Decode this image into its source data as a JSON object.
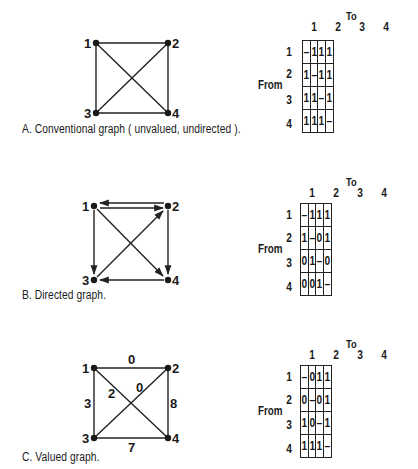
{
  "panels": [
    {
      "id": "A",
      "caption": "A. Conventional graph ( unvalued, undirected ).",
      "graph": {
        "type": "undirected",
        "nodes": [
          "1",
          "2",
          "3",
          "4"
        ],
        "edges": [
          {
            "from": "1",
            "to": "2"
          },
          {
            "from": "1",
            "to": "3"
          },
          {
            "from": "1",
            "to": "4"
          },
          {
            "from": "2",
            "to": "3"
          },
          {
            "from": "2",
            "to": "4"
          },
          {
            "from": "3",
            "to": "4"
          }
        ]
      },
      "matrix": {
        "to_label": "To",
        "from_label": "From",
        "columns": [
          "1",
          "2",
          "3",
          "4"
        ],
        "rows": [
          {
            "label": "1",
            "cells": [
              "–",
              "1",
              "1",
              "1"
            ]
          },
          {
            "label": "2",
            "cells": [
              "1",
              "–",
              "1",
              "1"
            ]
          },
          {
            "label": "3",
            "cells": [
              "1",
              "1",
              "–",
              "1"
            ]
          },
          {
            "label": "4",
            "cells": [
              "1",
              "1",
              "1",
              "–"
            ]
          }
        ]
      }
    },
    {
      "id": "B",
      "caption": "B. Directed graph.",
      "graph": {
        "type": "directed",
        "nodes": [
          "1",
          "2",
          "3",
          "4"
        ],
        "edges": [
          {
            "from": "1",
            "to": "2"
          },
          {
            "from": "2",
            "to": "1"
          },
          {
            "from": "1",
            "to": "3"
          },
          {
            "from": "1",
            "to": "4"
          },
          {
            "from": "2",
            "to": "4"
          },
          {
            "from": "3",
            "to": "2"
          },
          {
            "from": "4",
            "to": "3"
          }
        ]
      },
      "matrix": {
        "to_label": "To",
        "from_label": "From",
        "columns": [
          "1",
          "2",
          "3",
          "4"
        ],
        "rows": [
          {
            "label": "1",
            "cells": [
              "–",
              "1",
              "1",
              "1"
            ]
          },
          {
            "label": "2",
            "cells": [
              "1",
              "–",
              "0",
              "1"
            ]
          },
          {
            "label": "3",
            "cells": [
              "0",
              "1",
              "–",
              "0"
            ]
          },
          {
            "label": "4",
            "cells": [
              "0",
              "0",
              "1",
              "–"
            ]
          }
        ]
      }
    },
    {
      "id": "C",
      "caption": "C. Valued graph.",
      "graph": {
        "type": "valued",
        "nodes": [
          "1",
          "2",
          "3",
          "4"
        ],
        "edges": [
          {
            "from": "1",
            "to": "2",
            "value": "0"
          },
          {
            "from": "1",
            "to": "3",
            "value": "3"
          },
          {
            "from": "1",
            "to": "4",
            "value": "2"
          },
          {
            "from": "2",
            "to": "3",
            "value": "0"
          },
          {
            "from": "2",
            "to": "4",
            "value": "8"
          },
          {
            "from": "3",
            "to": "4",
            "value": "7"
          }
        ]
      },
      "matrix": {
        "to_label": "To",
        "from_label": "From",
        "columns": [
          "1",
          "2",
          "3",
          "4"
        ],
        "rows": [
          {
            "label": "1",
            "cells": [
              "–",
              "0",
              "1",
              "1"
            ]
          },
          {
            "label": "2",
            "cells": [
              "0",
              "–",
              "0",
              "1"
            ]
          },
          {
            "label": "3",
            "cells": [
              "1",
              "0",
              "–",
              "1"
            ]
          },
          {
            "label": "4",
            "cells": [
              "1",
              "1",
              "1",
              "–"
            ]
          }
        ]
      }
    }
  ]
}
